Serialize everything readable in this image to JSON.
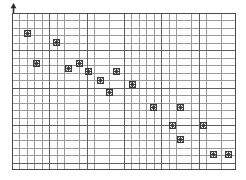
{
  "chart_data": {
    "type": "scatter",
    "title": "",
    "subtitle": "",
    "xlabel": "",
    "ylabel": "",
    "xlim": [
      0,
      30
    ],
    "ylim": [
      0,
      21
    ],
    "grid": true,
    "grid_minor": true,
    "grid_major_every": 5,
    "legend": null,
    "legend_position": "none",
    "xticklabels": [],
    "yticklabels": [],
    "marker": "asterisk-square",
    "marker_color": "#3a3a3a",
    "series": [
      {
        "name": "series-1",
        "points": [
          {
            "x": 2.1,
            "y": 18.2
          },
          {
            "x": 6.0,
            "y": 17.1
          },
          {
            "x": 3.3,
            "y": 14.3
          },
          {
            "x": 9.1,
            "y": 14.3
          },
          {
            "x": 10.2,
            "y": 13.2
          },
          {
            "x": 14.0,
            "y": 13.2
          },
          {
            "x": 13.1,
            "y": 10.3
          },
          {
            "x": 16.1,
            "y": 11.5
          },
          {
            "x": 22.6,
            "y": 8.3
          },
          {
            "x": 21.5,
            "y": 6.0
          },
          {
            "x": 22.6,
            "y": 4.1
          },
          {
            "x": 25.7,
            "y": 6.0
          },
          {
            "x": 27.0,
            "y": 2.1
          },
          {
            "x": 29.0,
            "y": 2.1
          },
          {
            "x": 19.0,
            "y": 8.3
          },
          {
            "x": 11.8,
            "y": 12.0
          },
          {
            "x": 7.6,
            "y": 13.6
          }
        ]
      }
    ]
  },
  "axes": {
    "y_axis_arrow": "arrow-up-icon",
    "panel_left_px": 12,
    "panel_top_px": 13,
    "panel_width_px": 224,
    "panel_height_px": 157
  },
  "colors": {
    "background": "#ffffff",
    "grid_major": "#5e5e5e",
    "grid_minor": "#9a9a9a",
    "border": "#4a4a4a",
    "marker": "#3a3a3a"
  }
}
